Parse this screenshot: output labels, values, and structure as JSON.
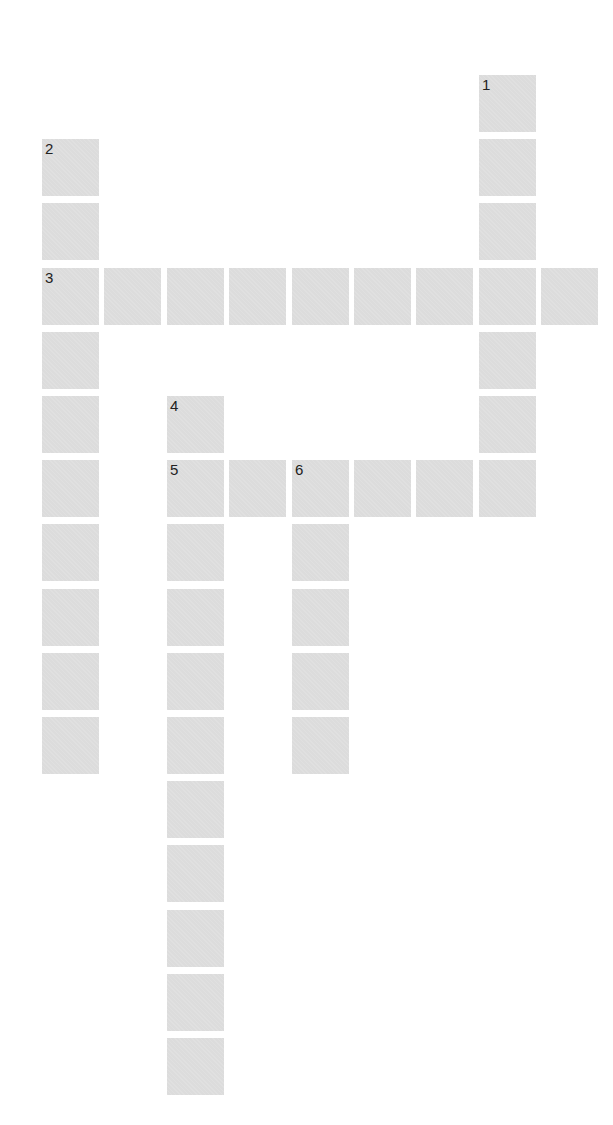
{
  "puzzle": {
    "layout": {
      "origin_x": 42,
      "origin_y": 75,
      "pitch_x": 62.4,
      "pitch_y": 64.2,
      "cell_size": 57
    },
    "colors": {
      "cell": "#dcdcdc",
      "number": "#222222",
      "background": "#ffffff"
    },
    "entries": [
      {
        "number": "1",
        "direction": "down",
        "col": 7,
        "row": 0,
        "length": 7
      },
      {
        "number": "2",
        "direction": "down",
        "col": 0,
        "row": 1,
        "length": 10
      },
      {
        "number": "3",
        "direction": "across",
        "col": 0,
        "row": 3,
        "length": 9
      },
      {
        "number": "4",
        "direction": "down",
        "col": 2,
        "row": 5,
        "length": 11
      },
      {
        "number": "5",
        "direction": "across",
        "col": 2,
        "row": 6,
        "length": 6
      },
      {
        "number": "6",
        "direction": "down",
        "col": 4,
        "row": 6,
        "length": 5
      }
    ]
  }
}
